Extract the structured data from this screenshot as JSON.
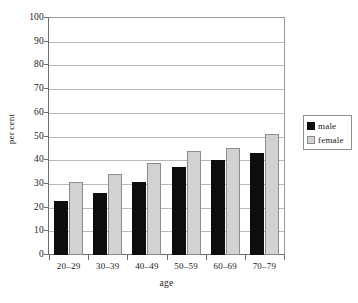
{
  "chart_data": {
    "type": "bar",
    "title": "",
    "xlabel": "age",
    "ylabel": "per cent",
    "categories": [
      "20–29",
      "30–39",
      "40–49",
      "50–59",
      "60–69",
      "70–79"
    ],
    "series": [
      {
        "name": "male",
        "color": "#0d0d0d",
        "values": [
          23,
          26,
          31,
          37,
          40,
          43
        ]
      },
      {
        "name": "female",
        "color": "#d2d2d2",
        "values": [
          31,
          34,
          39,
          44,
          45,
          51
        ]
      }
    ],
    "ylim": [
      0,
      100
    ],
    "ytick_labels": [
      "100",
      "90",
      "80",
      "70",
      "60",
      "50",
      "40",
      "30",
      "20",
      "10",
      "0"
    ],
    "ytick_values": [
      100,
      90,
      80,
      70,
      60,
      50,
      40,
      30,
      20,
      10,
      0
    ],
    "grid": true,
    "grid_axis": "y",
    "legend_position": "right"
  }
}
